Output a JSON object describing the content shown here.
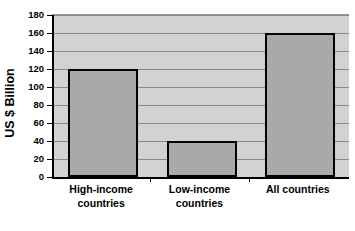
{
  "chart_data": {
    "type": "bar",
    "title": "",
    "subtitle": "",
    "xlabel": "",
    "ylabel": "US $ Billion",
    "categories": [
      "High-income countries",
      "Low-income countries",
      "All countries"
    ],
    "category_lines": [
      [
        "High-income",
        "countries"
      ],
      [
        "Low-income",
        "countries"
      ],
      [
        "All countries"
      ]
    ],
    "values": [
      120,
      40,
      160
    ],
    "ylim": [
      0,
      180
    ],
    "ytick_step": 20,
    "yticks": [
      180,
      160,
      140,
      120,
      100,
      80,
      60,
      40,
      20,
      0
    ],
    "ytick_labels": [
      "180",
      "160",
      "140",
      "120",
      "100",
      "80",
      "60",
      "40",
      "20",
      "0"
    ],
    "grid": true,
    "grid_axis": "y",
    "legend": false,
    "legend_position": "none",
    "series": [
      {
        "name": "US $ Billion",
        "values": [
          120,
          40,
          160
        ]
      }
    ],
    "colors": {
      "bar_fill": "#a9a9a9",
      "bar_border": "#000000",
      "plot_background": "#d2d2d2",
      "gridline": "#8a8a8a",
      "axis": "#000000",
      "page_background": "#ffffff",
      "text": "#000000"
    }
  }
}
